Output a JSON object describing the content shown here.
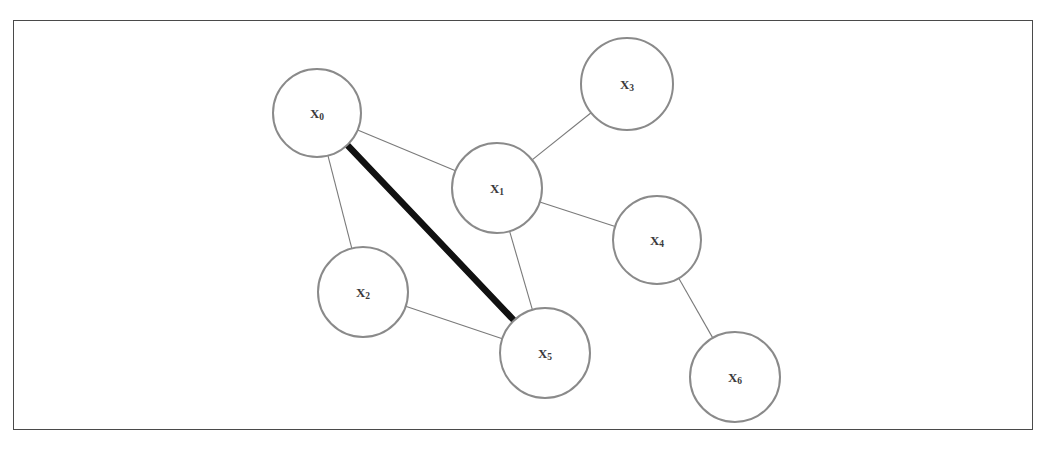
{
  "diagram": {
    "frame": {
      "x": 13,
      "y": 20,
      "width": 1020,
      "height": 410,
      "border_color": "#4a4a4a"
    },
    "node_style": {
      "radius": 45,
      "fill_color": "#ffffff",
      "stroke_color": "#8a8a8a"
    },
    "edge_style": {
      "normal_color": "#7a7a7a",
      "highlight_color": "#111111"
    },
    "nodes": [
      {
        "id": "x0",
        "label": "X",
        "subscript": "0",
        "cx": 317,
        "cy": 113,
        "r": 44
      },
      {
        "id": "x1",
        "label": "X",
        "subscript": "1",
        "cx": 497,
        "cy": 188,
        "r": 45
      },
      {
        "id": "x2",
        "label": "X",
        "subscript": "2",
        "cx": 363,
        "cy": 292,
        "r": 45
      },
      {
        "id": "x3",
        "label": "X",
        "subscript": "3",
        "cx": 627,
        "cy": 84,
        "r": 46
      },
      {
        "id": "x4",
        "label": "X",
        "subscript": "4",
        "cx": 657,
        "cy": 240,
        "r": 44
      },
      {
        "id": "x5",
        "label": "X",
        "subscript": "5",
        "cx": 545,
        "cy": 353,
        "r": 45
      },
      {
        "id": "x6",
        "label": "X",
        "subscript": "6",
        "cx": 735,
        "cy": 377,
        "r": 45
      }
    ],
    "edges": [
      {
        "id": "e-x0-x1",
        "from": "x0",
        "to": "x1",
        "highlighted": false
      },
      {
        "id": "e-x0-x2",
        "from": "x0",
        "to": "x2",
        "highlighted": false
      },
      {
        "id": "e-x0-x5",
        "from": "x0",
        "to": "x5",
        "highlighted": true
      },
      {
        "id": "e-x1-x3",
        "from": "x1",
        "to": "x3",
        "highlighted": false
      },
      {
        "id": "e-x1-x4",
        "from": "x1",
        "to": "x4",
        "highlighted": false
      },
      {
        "id": "e-x1-x5",
        "from": "x1",
        "to": "x5",
        "highlighted": false
      },
      {
        "id": "e-x2-x5",
        "from": "x2",
        "to": "x5",
        "highlighted": false
      },
      {
        "id": "e-x4-x6",
        "from": "x4",
        "to": "x6",
        "highlighted": false
      }
    ]
  }
}
